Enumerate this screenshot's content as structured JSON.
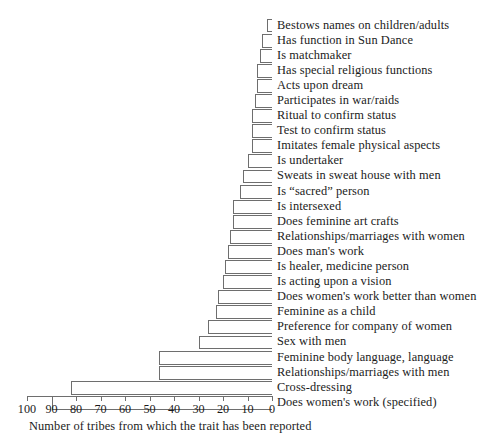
{
  "chart_data": {
    "type": "bar",
    "orientation": "horizontal",
    "title": "",
    "subtitle": "",
    "xlabel": "Number of tribes from which the trait has been reported",
    "ylabel": "",
    "xlim": [
      100,
      0
    ],
    "x_axis_reversed": true,
    "xticks": [
      100,
      90,
      80,
      70,
      60,
      50,
      40,
      30,
      20,
      10,
      0
    ],
    "xtick_labels": [
      "100",
      "90",
      "80",
      "70",
      "60",
      "50",
      "40",
      "30",
      "20",
      "10",
      "0"
    ],
    "grid": false,
    "legend": "none",
    "bar_fill": "#ffffff",
    "bar_edge": "#6e6e6e",
    "categories": [
      "Bestows names on children/adults",
      "Has function in Sun Dance",
      "Is matchmaker",
      "Has special religious functions",
      "Acts upon dream",
      "Participates in war/raids",
      "Ritual to confirm status",
      "Test to confirm status",
      "Imitates female physical aspects",
      "Is undertaker",
      "Sweats in sweat house with men",
      "Is “sacred” person",
      "Is intersexed",
      "Does feminine art crafts",
      "Relationships/marriages with women",
      "Does man's work",
      "Is healer, medicine person",
      "Is acting upon a vision",
      "Does women's work better than women",
      "Feminine as a child",
      "Preference for company of women",
      "Sex with men",
      "Feminine body language, language",
      "Relationships/marriages with men",
      "Cross-dressing",
      "Does women's work (specified)"
    ],
    "values": [
      2,
      4,
      5,
      6,
      6,
      7,
      8,
      8,
      8,
      10,
      12,
      13,
      16,
      16,
      17,
      18,
      19,
      20,
      22,
      23,
      26,
      30,
      46,
      46,
      82,
      90
    ]
  },
  "axis": {
    "caption": "Number of tribes from which the trait has been reported"
  }
}
